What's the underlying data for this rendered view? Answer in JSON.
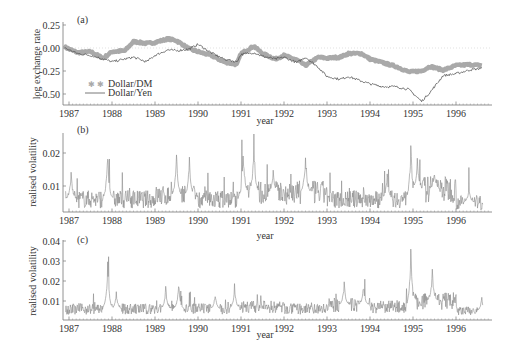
{
  "chart_data": [
    {
      "panel": "(a)",
      "type": "line",
      "title": "",
      "xlabel": "year",
      "ylabel": "log exchange rate",
      "xlim": [
        1986.85,
        1996.8
      ],
      "ylim": [
        -0.6,
        0.25
      ],
      "yticks": [
        "0.25",
        "0.00",
        "-0.25",
        "-0.50"
      ],
      "xticks": [
        "1987",
        "1988",
        "1989",
        "1990",
        "1991",
        "1992",
        "1993",
        "1994",
        "1995",
        "1996"
      ],
      "legend": [
        "Dollar/DM",
        "Dollar/Yen"
      ],
      "legend_position": "lower left",
      "reference_line": 0.0,
      "series": [
        {
          "name": "Dollar/DM",
          "style": "thick markers",
          "x": [
            1986.9,
            1987.2,
            1987.5,
            1987.8,
            1988.0,
            1988.3,
            1988.5,
            1988.8,
            1989.0,
            1989.3,
            1989.5,
            1989.8,
            1990.0,
            1990.3,
            1990.6,
            1990.9,
            1991.0,
            1991.3,
            1991.5,
            1991.8,
            1992.0,
            1992.3,
            1992.5,
            1992.8,
            1993.0,
            1993.3,
            1993.5,
            1993.8,
            1994.0,
            1994.3,
            1994.6,
            1994.9,
            1995.2,
            1995.4,
            1995.7,
            1996.0,
            1996.3,
            1996.6
          ],
          "values": [
            0.01,
            -0.05,
            -0.04,
            -0.11,
            -0.04,
            -0.03,
            0.07,
            0.05,
            0.06,
            0.1,
            0.08,
            -0.01,
            -0.04,
            -0.08,
            -0.15,
            -0.18,
            -0.06,
            0.02,
            -0.06,
            -0.12,
            -0.08,
            -0.13,
            -0.19,
            -0.1,
            -0.11,
            -0.1,
            -0.06,
            -0.06,
            -0.12,
            -0.16,
            -0.2,
            -0.26,
            -0.25,
            -0.2,
            -0.24,
            -0.19,
            -0.18,
            -0.19
          ]
        },
        {
          "name": "Dollar/Yen",
          "style": "thin line",
          "x": [
            1986.9,
            1987.2,
            1987.5,
            1987.8,
            1988.0,
            1988.3,
            1988.5,
            1988.8,
            1989.0,
            1989.3,
            1989.5,
            1989.8,
            1990.0,
            1990.3,
            1990.6,
            1990.9,
            1991.0,
            1991.3,
            1991.5,
            1991.8,
            1992.0,
            1992.3,
            1992.5,
            1992.8,
            1993.0,
            1993.3,
            1993.5,
            1993.8,
            1994.0,
            1994.3,
            1994.6,
            1994.9,
            1995.2,
            1995.4,
            1995.7,
            1996.0,
            1996.3,
            1996.6
          ],
          "values": [
            0.0,
            -0.06,
            -0.08,
            -0.12,
            -0.15,
            -0.12,
            -0.1,
            -0.15,
            -0.08,
            -0.02,
            -0.03,
            -0.01,
            0.04,
            -0.05,
            -0.12,
            -0.15,
            -0.07,
            -0.05,
            -0.09,
            -0.12,
            -0.1,
            -0.16,
            -0.1,
            -0.21,
            -0.31,
            -0.34,
            -0.31,
            -0.36,
            -0.39,
            -0.42,
            -0.42,
            -0.45,
            -0.58,
            -0.48,
            -0.3,
            -0.28,
            -0.24,
            -0.22
          ]
        }
      ]
    },
    {
      "panel": "(b)",
      "type": "line",
      "xlabel": "year",
      "ylabel": "realised volatility",
      "xlim": [
        1986.85,
        1996.8
      ],
      "ylim": [
        0.002,
        0.026
      ],
      "yticks": [
        "0.02",
        "0.01"
      ],
      "xticks": [
        "1987",
        "1988",
        "1989",
        "1990",
        "1991",
        "1992",
        "1993",
        "1994",
        "1995",
        "1996"
      ],
      "series": [
        {
          "name": "realised volatility (b)",
          "baseline_by_year": {
            "1987": 0.006,
            "1988": 0.006,
            "1989": 0.007,
            "1990": 0.006,
            "1991": 0.008,
            "1992": 0.008,
            "1993": 0.006,
            "1994": 0.006,
            "1995": 0.009,
            "1996": 0.005
          },
          "peaks": [
            [
              1987.05,
              0.015
            ],
            [
              1987.9,
              0.022
            ],
            [
              1989.5,
              0.021
            ],
            [
              1989.8,
              0.019
            ],
            [
              1991.05,
              0.023
            ],
            [
              1991.3,
              0.025
            ],
            [
              1991.75,
              0.015
            ],
            [
              1992.5,
              0.021
            ],
            [
              1994.4,
              0.015
            ],
            [
              1994.95,
              0.024
            ],
            [
              1995.1,
              0.019
            ],
            [
              1995.5,
              0.015
            ],
            [
              1996.3,
              0.01
            ]
          ]
        }
      ]
    },
    {
      "panel": "(c)",
      "type": "line",
      "xlabel": "year",
      "ylabel": "realised volatility",
      "xlim": [
        1986.85,
        1996.8
      ],
      "ylim": [
        0.0,
        0.04
      ],
      "yticks": [
        "0.04",
        "0.03",
        "0.02",
        "0.01"
      ],
      "xticks": [
        "1987",
        "1988",
        "1989",
        "1990",
        "1991",
        "1992",
        "1993",
        "1994",
        "1995",
        "1996"
      ],
      "series": [
        {
          "name": "realised volatility (c)",
          "baseline_by_year": {
            "1987": 0.006,
            "1988": 0.006,
            "1989": 0.006,
            "1990": 0.006,
            "1991": 0.007,
            "1992": 0.006,
            "1993": 0.008,
            "1994": 0.007,
            "1995": 0.01,
            "1996": 0.005
          },
          "peaks": [
            [
              1987.9,
              0.031
            ],
            [
              1988.1,
              0.015
            ],
            [
              1989.25,
              0.018
            ],
            [
              1989.55,
              0.02
            ],
            [
              1990.4,
              0.014
            ],
            [
              1990.85,
              0.019
            ],
            [
              1993.4,
              0.02
            ],
            [
              1993.85,
              0.019
            ],
            [
              1994.95,
              0.038
            ],
            [
              1995.45,
              0.026
            ],
            [
              1996.6,
              0.012
            ]
          ]
        }
      ]
    }
  ],
  "labels": {
    "panel_a": "(a)",
    "panel_b": "(b)",
    "panel_c": "(c)",
    "ylabel_a": "log exchange rate",
    "ylabel_b": "realised volatility",
    "ylabel_c": "realised volatility",
    "xlabel": "year",
    "legend_dm": "Dollar/DM",
    "legend_yen": "Dollar/Yen"
  },
  "colors": {
    "dm": "#9a9a9a",
    "yen": "#555555",
    "vol": "#8a8a8a",
    "axis": "#777777",
    "text": "#333333"
  }
}
